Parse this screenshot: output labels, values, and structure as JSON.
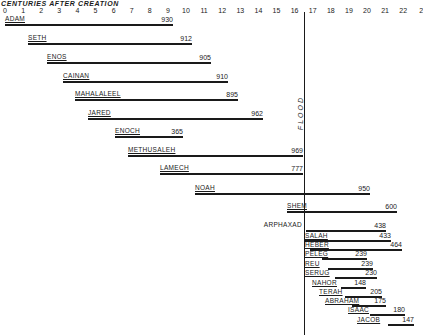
{
  "chart_data": {
    "type": "bar",
    "orientation": "horizontal-timeline",
    "title": "CENTURIES AFTER CREATION",
    "xlabel": "Centuries after creation",
    "ylabel": "",
    "x_ticks": [
      "0",
      "1",
      "2",
      "3",
      "4",
      "5",
      "6",
      "7",
      "8",
      "9",
      "10",
      "11",
      "12",
      "13",
      "14",
      "15",
      "16",
      "17",
      "18",
      "19",
      "20",
      "21",
      "22",
      "2"
    ],
    "xlim": [
      0,
      23
    ],
    "grid": false,
    "legend": null,
    "annotations": [
      {
        "text": "FLOOD",
        "x_century": 16.56,
        "orientation": "vertical"
      }
    ],
    "series": [
      {
        "name": "ADAM",
        "start": 0,
        "lifespan": 930
      },
      {
        "name": "SETH",
        "start": 130,
        "lifespan": 912
      },
      {
        "name": "ENOS",
        "start": 235,
        "lifespan": 905
      },
      {
        "name": "CAINAN",
        "start": 325,
        "lifespan": 910
      },
      {
        "name": "MAHALALEEL",
        "start": 395,
        "lifespan": 895
      },
      {
        "name": "JARED",
        "start": 460,
        "lifespan": 962
      },
      {
        "name": "ENOCH",
        "start": 622,
        "lifespan": 365
      },
      {
        "name": "METHUSALEH",
        "start": 687,
        "lifespan": 969
      },
      {
        "name": "LAMECH",
        "start": 874,
        "lifespan": 777
      },
      {
        "name": "NOAH",
        "start": 1056,
        "lifespan": 950
      },
      {
        "name": "SHEM",
        "start": 1558,
        "lifespan": 600
      },
      {
        "name": "ARPHAXAD",
        "start": 1658,
        "lifespan": 438
      },
      {
        "name": "SALAH",
        "start": 1693,
        "lifespan": 433
      },
      {
        "name": "HEBER",
        "start": 1723,
        "lifespan": 464
      },
      {
        "name": "PELEG",
        "start": 1757,
        "lifespan": 239
      },
      {
        "name": "REU",
        "start": 1787,
        "lifespan": 239
      },
      {
        "name": "SERUG",
        "start": 1819,
        "lifespan": 230
      },
      {
        "name": "NAHOR",
        "start": 1849,
        "lifespan": 148
      },
      {
        "name": "TERAH",
        "start": 1878,
        "lifespan": 205
      },
      {
        "name": "ABRAHAM",
        "start": 1948,
        "lifespan": 175
      },
      {
        "name": "ISAAC",
        "start": 2048,
        "lifespan": 180
      },
      {
        "name": "JACOB",
        "start": 2108,
        "lifespan": 147
      }
    ]
  },
  "layout_rows": [
    {
      "name": "ADAM",
      "x1": 5,
      "x2": 173,
      "y": 24,
      "label_x": 5,
      "label_y": 15,
      "label_align": "left"
    },
    {
      "name": "SETH",
      "x1": 28,
      "x2": 192,
      "y": 43,
      "label_x": 28,
      "label_y": 34,
      "label_align": "left"
    },
    {
      "name": "ENOS",
      "x1": 47,
      "x2": 211,
      "y": 62,
      "label_x": 47,
      "label_y": 53,
      "label_align": "left"
    },
    {
      "name": "CAINAN",
      "x1": 63,
      "x2": 228,
      "y": 81,
      "label_x": 63,
      "label_y": 72,
      "label_align": "left"
    },
    {
      "name": "MAHALALEEL",
      "x1": 75,
      "x2": 238,
      "y": 99,
      "label_x": 75,
      "label_y": 90,
      "label_align": "left"
    },
    {
      "name": "JARED",
      "x1": 88,
      "x2": 263,
      "y": 118,
      "label_x": 88,
      "label_y": 109,
      "label_align": "left"
    },
    {
      "name": "ENOCH",
      "x1": 115,
      "x2": 183,
      "y": 136,
      "label_x": 115,
      "label_y": 127,
      "label_align": "left"
    },
    {
      "name": "METHUSALEH",
      "x1": 128,
      "x2": 303,
      "y": 155,
      "label_x": 128,
      "label_y": 146,
      "label_align": "left"
    },
    {
      "name": "LAMECH",
      "x1": 160,
      "x2": 303,
      "y": 173,
      "label_x": 160,
      "label_y": 164,
      "label_align": "left"
    },
    {
      "name": "NOAH",
      "x1": 195,
      "x2": 370,
      "y": 193,
      "label_x": 195,
      "label_y": 184,
      "label_align": "left"
    },
    {
      "name": "SHEM",
      "x1": 287,
      "x2": 397,
      "y": 211,
      "label_x": 287,
      "label_y": 202,
      "label_align": "left"
    },
    {
      "name": "ARPHAXAD",
      "x1": 306,
      "x2": 386,
      "y": 230,
      "label_x": 302,
      "label_y": 221,
      "label_align": "right"
    },
    {
      "name": "SALAH",
      "x1": 305,
      "x2": 391,
      "y": 240,
      "label_x": 305,
      "label_y": 232,
      "label_align": "left"
    },
    {
      "name": "HEBER",
      "x1": 310,
      "x2": 402,
      "y": 249,
      "label_x": 305,
      "label_y": 241,
      "label_align": "left"
    },
    {
      "name": "PELEG",
      "x1": 322,
      "x2": 367,
      "y": 258,
      "label_x": 305,
      "label_y": 250,
      "label_align": "left"
    },
    {
      "name": "REU",
      "x1": 328,
      "x2": 373,
      "y": 268,
      "label_x": 305,
      "label_y": 260,
      "label_align": "left"
    },
    {
      "name": "SERUG",
      "x1": 335,
      "x2": 377,
      "y": 277,
      "label_x": 305,
      "label_y": 269,
      "label_align": "left"
    },
    {
      "name": "NAHOR",
      "x1": 341,
      "x2": 366,
      "y": 287,
      "label_x": 312,
      "label_y": 279,
      "label_align": "left"
    },
    {
      "name": "TERAH",
      "x1": 345,
      "x2": 382,
      "y": 296,
      "label_x": 319,
      "label_y": 288,
      "label_align": "left"
    },
    {
      "name": "ABRAHAM",
      "x1": 352,
      "x2": 386,
      "y": 305,
      "label_x": 325,
      "label_y": 297,
      "label_align": "left"
    },
    {
      "name": "ISAAC",
      "x1": 370,
      "x2": 405,
      "y": 314,
      "label_x": 348,
      "label_y": 306,
      "label_align": "left"
    },
    {
      "name": "JACOB",
      "x1": 388,
      "x2": 414,
      "y": 324,
      "label_x": 357,
      "label_y": 316,
      "label_align": "left"
    }
  ],
  "axis": {
    "origin_x": 5,
    "px_per_century": 18.1
  },
  "flood": {
    "label": "FLOOD",
    "x": 304,
    "top": 12,
    "bottom": 335,
    "label_x": 297,
    "label_y": 96
  },
  "colors": {
    "ink": "#1a1a1a",
    "background": "#ffffff"
  }
}
